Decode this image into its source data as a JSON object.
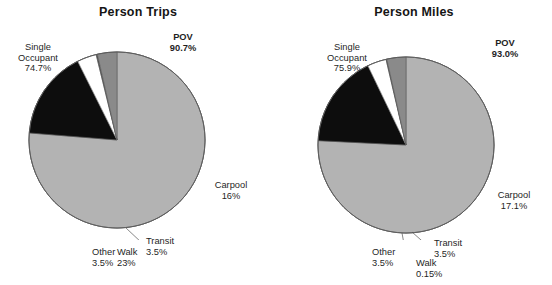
{
  "page": {
    "background": "#ffffff",
    "width": 552,
    "height": 285
  },
  "colors": {
    "single_occupant": "#b3b3b3",
    "carpool": "#0d0d0d",
    "transit": "#ffffff",
    "walk": "#4d4d4d",
    "other": "#8a8a8a",
    "outline": "#5a5a5a",
    "text": "#1f1f1f"
  },
  "charts": [
    {
      "id": "person-trips",
      "title": "Person Trips",
      "labels": {
        "single_occupant": "Single\nOccupant\n74.7%",
        "pov": "POV\n90.7%",
        "carpool": "Carpool\n16%",
        "transit": "Transit\n3.5%",
        "walk": "Walk\n23%",
        "other": "Other\n3.5%"
      }
    },
    {
      "id": "person-miles",
      "title": "Person Miles",
      "labels": {
        "single_occupant": "Single\nOccupant\n75.9%",
        "pov": "POV\n93.0%",
        "carpool": "Carpool\n17.1%",
        "transit": "Transit\n3.5%",
        "walk": "Walk\n0.15%",
        "other": "Other\n3.5%"
      }
    }
  ],
  "chart_data": [
    {
      "type": "pie",
      "title": "Person Trips",
      "categories": [
        "Single Occupant",
        "Carpool",
        "Transit",
        "Walk",
        "Other"
      ],
      "values": [
        74.7,
        16,
        3.5,
        0.23,
        3.5
      ],
      "value_labels": [
        "74.7%",
        "16%",
        "3.5%",
        "23%",
        "3.5%"
      ],
      "colors": [
        "#b3b3b3",
        "#0d0d0d",
        "#ffffff",
        "#4d4d4d",
        "#8a8a8a"
      ],
      "annotations": [
        {
          "text": "POV",
          "value": 90.7,
          "value_label": "90.7%",
          "note": "Single Occupant + Carpool"
        }
      ],
      "start_angle": 0,
      "direction": "clockwise",
      "legend": "none",
      "labels_position": "outside"
    },
    {
      "type": "pie",
      "title": "Person Miles",
      "categories": [
        "Single Occupant",
        "Carpool",
        "Transit",
        "Walk",
        "Other"
      ],
      "values": [
        75.9,
        17.1,
        3.5,
        0.15,
        3.5
      ],
      "value_labels": [
        "75.9%",
        "17.1%",
        "3.5%",
        "0.15%",
        "3.5%"
      ],
      "colors": [
        "#b3b3b3",
        "#0d0d0d",
        "#ffffff",
        "#4d4d4d",
        "#8a8a8a"
      ],
      "annotations": [
        {
          "text": "POV",
          "value": 93.0,
          "value_label": "93.0%",
          "note": "Single Occupant + Carpool"
        }
      ],
      "start_angle": 0,
      "direction": "clockwise",
      "legend": "none",
      "labels_position": "outside"
    }
  ]
}
